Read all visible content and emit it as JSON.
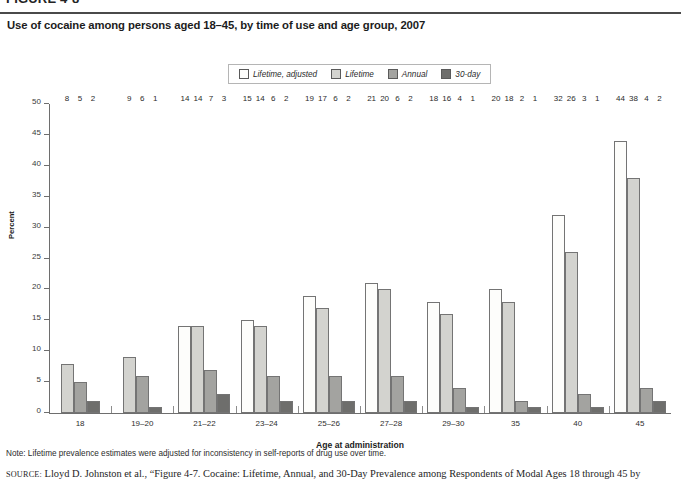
{
  "figure": {
    "number": "FIGURE 4-8",
    "title": "Use of cocaine among persons aged 18–45, by time of use and age group, 2007"
  },
  "note": "Note: Lifetime prevalence estimates were adjusted for inconsistency in self-reports of drug use over time.",
  "source": {
    "prefix": "SOURCE:",
    "text": "Lloyd D. Johnston et al., “Figure 4-7. Cocaine: Lifetime, Annual, and 30-Day Prevalence among Respondents of Modal Ages 18 through 45 by"
  },
  "colors": {
    "lifetime_adjusted": "#fdfdfb",
    "lifetime": "#d3d3cf",
    "annual": "#a3a3a0",
    "thirty_day": "#6e6e6c",
    "axis": "#6e6e6e",
    "text": "#1c1c1c",
    "legend_border": "#b5b5b5"
  },
  "chart_data": {
    "type": "bar",
    "title": "Use of cocaine among persons aged 18–45, by time of use and age group, 2007",
    "xlabel": "Age at administration",
    "ylabel": "Percent",
    "ylim": [
      0,
      50
    ],
    "ytick_step": 5,
    "yticks": [
      0,
      5,
      10,
      15,
      20,
      25,
      30,
      35,
      40,
      45,
      50
    ],
    "grid": false,
    "legend_position": "top-center",
    "categories": [
      "18",
      "19–20",
      "21–22",
      "23–24",
      "25–26",
      "27–28",
      "29–30",
      "35",
      "40",
      "45"
    ],
    "series": [
      {
        "name": "Lifetime, adjusted",
        "color": "#fdfdfb",
        "values": [
          null,
          null,
          14,
          15,
          19,
          21,
          18,
          20,
          32,
          44
        ]
      },
      {
        "name": "Lifetime",
        "color": "#d3d3cf",
        "values": [
          8,
          9,
          14,
          14,
          17,
          20,
          16,
          18,
          26,
          38
        ]
      },
      {
        "name": "Annual",
        "color": "#a3a3a0",
        "values": [
          5,
          6,
          7,
          6,
          6,
          6,
          4,
          2,
          3,
          4
        ]
      },
      {
        "name": "30-day",
        "color": "#6e6e6c",
        "values": [
          2,
          1,
          3,
          2,
          2,
          2,
          1,
          1,
          1,
          2
        ]
      }
    ]
  }
}
